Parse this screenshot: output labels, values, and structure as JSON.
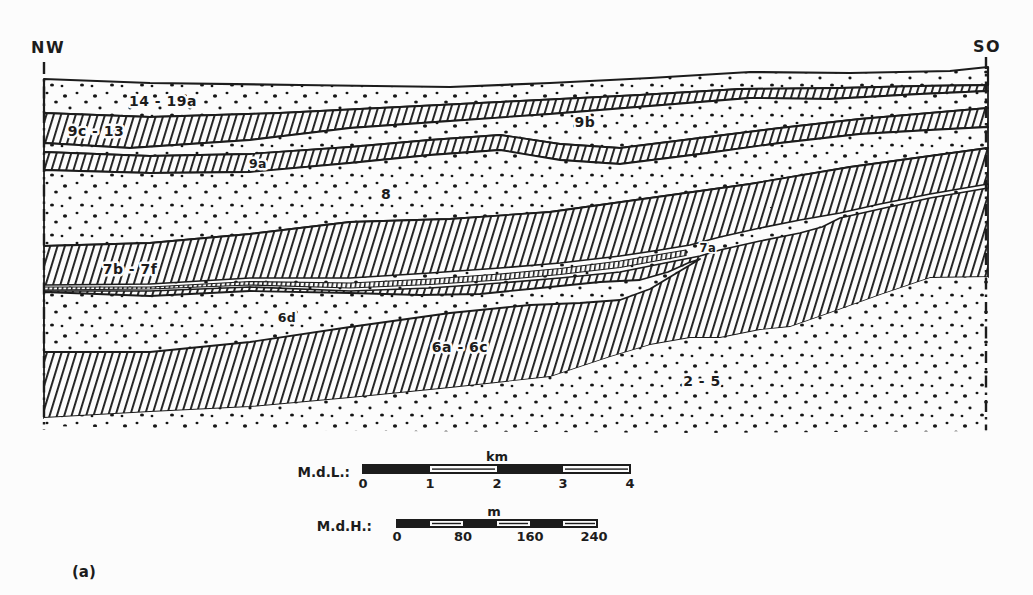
{
  "figure": {
    "type": "geological-cross-section",
    "panel_label": "(a)",
    "orientation": {
      "left": "NW",
      "right": "SO"
    },
    "layers": [
      {
        "id": "14-19a",
        "label": "14 - 19a",
        "texture": "stipple"
      },
      {
        "id": "9c-13",
        "label": "9c - 13",
        "texture": "hatch"
      },
      {
        "id": "9b",
        "label": "9b",
        "texture": "stipple"
      },
      {
        "id": "9a",
        "label": "9a",
        "texture": "hatch"
      },
      {
        "id": "8",
        "label": "8",
        "texture": "stipple"
      },
      {
        "id": "7a",
        "label": "7a",
        "texture": "stipple-seam"
      },
      {
        "id": "7b-7f",
        "label": "7b - 7f",
        "texture": "hatch"
      },
      {
        "id": "6d",
        "label": "6d",
        "texture": "stipple"
      },
      {
        "id": "6a-6c",
        "label": "6a - 6c",
        "texture": "hatch"
      },
      {
        "id": "2-5",
        "label": "2 - 5",
        "texture": "stipple"
      }
    ],
    "scale_bars": {
      "length": {
        "label": "M.d.L.:",
        "unit": "km",
        "ticks": [
          "0",
          "1",
          "2",
          "3",
          "4"
        ]
      },
      "height": {
        "label": "M.d.H.:",
        "unit": "m",
        "ticks": [
          "0",
          "80",
          "160",
          "240"
        ]
      }
    },
    "colors": {
      "ink": "#1c1c1c",
      "paper": "#fcfcfc"
    }
  }
}
